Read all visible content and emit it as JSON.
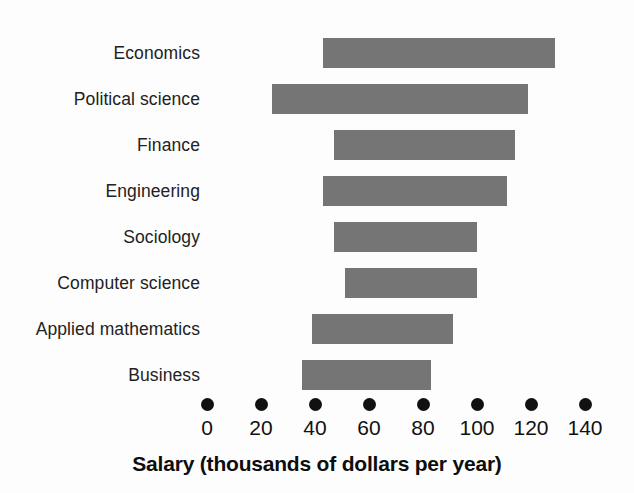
{
  "chart_data": {
    "type": "bar",
    "orientation": "horizontal",
    "title": "",
    "xlabel": "Salary (thousands of dollars per year)",
    "ylabel": "",
    "xlim": [
      0,
      140
    ],
    "xticks": [
      0,
      20,
      40,
      60,
      80,
      100,
      120,
      140
    ],
    "xtick_labels": [
      "0",
      "20",
      "40",
      "60",
      "80",
      "100",
      "120",
      "140"
    ],
    "grid": false,
    "legend": null,
    "note": "Each bar is a range (floating bar) showing the low-to-high salary span for the field.",
    "categories": [
      "Economics",
      "Political science",
      "Finance",
      "Engineering",
      "Sociology",
      "Computer science",
      "Applied mathematics",
      "Business"
    ],
    "series": [
      {
        "name": "Salary range (low)",
        "values": [
          43,
          24,
          47,
          43,
          47,
          51,
          39,
          35
        ]
      },
      {
        "name": "Salary range (high)",
        "values": [
          129,
          119,
          114,
          111,
          100,
          100,
          91,
          83
        ]
      }
    ],
    "bars": [
      {
        "category": "Economics",
        "low": 43,
        "high": 129
      },
      {
        "category": "Political science",
        "low": 24,
        "high": 119
      },
      {
        "category": "Finance",
        "low": 47,
        "high": 114
      },
      {
        "category": "Engineering",
        "low": 43,
        "high": 111
      },
      {
        "category": "Sociology",
        "low": 47,
        "high": 100
      },
      {
        "category": "Computer science",
        "low": 51,
        "high": 100
      },
      {
        "category": "Applied mathematics",
        "low": 39,
        "high": 91
      },
      {
        "category": "Business",
        "low": 35,
        "high": 83
      }
    ],
    "colors": {
      "bar": "#757575",
      "background": "#fdfdfd",
      "text": "#1a1a1a",
      "tick_dot": "#111111"
    }
  }
}
